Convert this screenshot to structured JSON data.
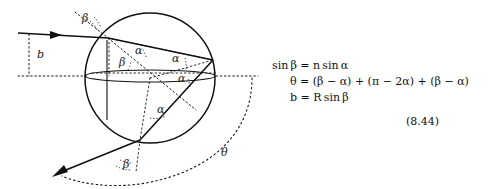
{
  "figure": {
    "type": "optics-ray-diagram-sphere",
    "labels": {
      "impact_parameter": "b",
      "incidence_angle_top": "β",
      "refraction_angle_entry": "α",
      "internal_angle_upper_right": "α",
      "internal_angle_lower_right": "α",
      "internal_angle_entry_lower": "β",
      "internal_angle_bottom": "α",
      "exit_angle": "β",
      "deflection_angle": "θ"
    },
    "label_list": [
      {
        "id": "beta-top",
        "text": "β",
        "x": 82,
        "y": 22
      },
      {
        "id": "b-label",
        "text": "b",
        "x": 37,
        "y": 58
      },
      {
        "id": "alpha-entry",
        "text": "α",
        "x": 135,
        "y": 54
      },
      {
        "id": "beta-entry",
        "text": "β",
        "x": 119,
        "y": 63
      },
      {
        "id": "alpha-upper-right",
        "text": "α",
        "x": 172,
        "y": 62
      },
      {
        "id": "alpha-lower-right",
        "text": "α",
        "x": 178,
        "y": 80
      },
      {
        "id": "alpha-bottom",
        "text": "α",
        "x": 157,
        "y": 112
      },
      {
        "id": "beta-exit",
        "text": "β",
        "x": 125,
        "y": 167
      },
      {
        "id": "theta-label",
        "text": "θ",
        "x": 222,
        "y": 155
      }
    ],
    "geometry": {
      "circle": {
        "cx": 150,
        "cy": 78,
        "r": 65
      },
      "entry_point": [
        108,
        38
      ],
      "reflection_point": [
        213,
        60
      ],
      "exit_point": [
        140,
        140
      ],
      "incoming_ray_from": [
        18,
        33
      ],
      "outgoing_ray_to": [
        52,
        177
      ]
    },
    "colors": {
      "stroke": "#1a1a1a",
      "background": "#ffffff"
    }
  },
  "equations": {
    "eq1": "sin β = n sin α",
    "eq2": "θ = (β − α) + (π − 2α) + (β − α)",
    "eq3": "b = R sin β",
    "tag": "(8.44)"
  }
}
